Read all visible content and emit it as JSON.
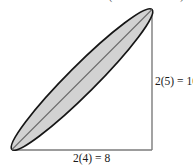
{
  "figure": {
    "caption_fragment": "minor axis is 8 inches. (See illustration.)",
    "background_color": "#ffffff",
    "ellipse": {
      "fill_color": "#d2d2d2",
      "stroke_color": "#161616",
      "axis_line_color": "#6d6d6d",
      "center_x": 82,
      "center_y": 79.5,
      "semi_major": 99,
      "semi_minor": 14,
      "rotation_deg": -45
    },
    "triangle": {
      "stroke_color": "#7b7b7b",
      "vertical_leg": {
        "x": 152,
        "y_top": 9,
        "y_bottom": 150
      },
      "horizontal_leg": {
        "y": 150,
        "x_left": 12,
        "x_right": 152
      }
    },
    "labels": {
      "vertical": "2(5) = 10",
      "horizontal": "2(4) = 8"
    }
  }
}
